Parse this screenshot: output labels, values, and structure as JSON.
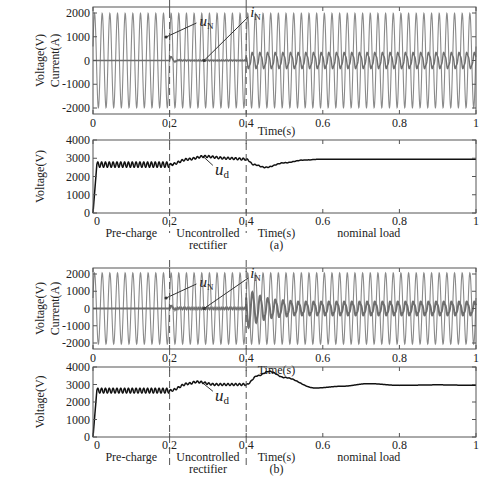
{
  "figure": {
    "panels": [
      {
        "id": "a",
        "caption": "(a)",
        "top_plot": {
          "ylabel_line1": "Voltage(V)",
          "ylabel_line2": "Current(A)",
          "xlabel": "Time(s)",
          "yticks": [
            "2000",
            "1000",
            "0",
            "-1000",
            "-2000"
          ],
          "xticks": [
            "0",
            "0.2",
            "0.4",
            "0.6",
            "0.8",
            "1"
          ],
          "annotations": {
            "voltage": "u",
            "voltage_sub": "N",
            "current": "i",
            "current_sub": "N"
          }
        },
        "bottom_plot": {
          "ylabel": "Voltage(V)",
          "xlabel": "Time(s)",
          "yticks": [
            "4000",
            "3000",
            "2000",
            "1000",
            "0"
          ],
          "xticks": [
            "0",
            "0.2",
            "0.4",
            "0.6",
            "0.8",
            "1"
          ],
          "annotation": "u",
          "annotation_sub": "d",
          "phase_labels": [
            "Pre-charge",
            "Uncontrolled",
            "rectifier",
            "nominal load"
          ]
        }
      },
      {
        "id": "b",
        "caption": "(b)",
        "top_plot": {
          "ylabel_line1": "Voltage(V)",
          "ylabel_line2": "Current(A)",
          "xlabel": "Time(s)",
          "yticks": [
            "2000",
            "1000",
            "0",
            "-1000",
            "-2000"
          ],
          "xticks": [
            "0",
            "0.2",
            "0.4",
            "0.6",
            "0.8",
            "1"
          ],
          "annotations": {
            "voltage": "u",
            "voltage_sub": "N",
            "current": "i",
            "current_sub": "N"
          }
        },
        "bottom_plot": {
          "ylabel": "Voltage(V)",
          "xlabel": "Time(s)",
          "yticks": [
            "4000",
            "3000",
            "2000",
            "1000",
            "0"
          ],
          "xticks": [
            "0",
            "0.2",
            "0.4",
            "0.6",
            "0.8",
            "1"
          ],
          "annotation": "u",
          "annotation_sub": "d",
          "phase_labels": [
            "Pre-charge",
            "Uncontrolled",
            "rectifier",
            "nominal load"
          ]
        }
      }
    ]
  },
  "chart_data": [
    {
      "type": "line",
      "title": "(a) grid voltage and current",
      "xlabel": "Time(s)",
      "ylabel": "Voltage(V) / Current(A)",
      "xlim": [
        0,
        1
      ],
      "ylim": [
        -2500,
        2500
      ],
      "series": [
        {
          "name": "u_N",
          "description": "grid voltage sinusoid, 50 Hz",
          "amplitude": 2200,
          "frequency_hz": 50
        },
        {
          "name": "i_N",
          "description": "grid current",
          "segments": [
            {
              "t": [
                0,
                0.2
              ],
              "amplitude": 0
            },
            {
              "t": [
                0.2,
                0.4
              ],
              "amplitude": 60,
              "note": "small transient at 0.2s then near zero"
            },
            {
              "t": [
                0.4,
                1.0
              ],
              "amplitude": 350
            }
          ]
        }
      ],
      "vlines": [
        0.2,
        0.4
      ]
    },
    {
      "type": "line",
      "title": "(a) DC-link voltage",
      "xlabel": "Time(s)",
      "ylabel": "Voltage(V)",
      "xlim": [
        0,
        1
      ],
      "ylim": [
        0,
        4000
      ],
      "series": [
        {
          "name": "u_d",
          "x": [
            0,
            0.01,
            0.2,
            0.25,
            0.29,
            0.35,
            0.4,
            0.42,
            0.45,
            0.5,
            0.55,
            0.6,
            0.8,
            1.0
          ],
          "y": [
            0,
            2650,
            2650,
            2950,
            3100,
            3000,
            2950,
            2650,
            2500,
            2750,
            2900,
            2950,
            2950,
            2950
          ]
        }
      ],
      "phase_labels": [
        "Pre-charge",
        "Uncontrolled rectifier",
        "nominal load"
      ],
      "vlines": [
        0.2,
        0.4
      ]
    },
    {
      "type": "line",
      "title": "(b) grid voltage and current",
      "xlabel": "Time(s)",
      "ylabel": "Voltage(V) / Current(A)",
      "xlim": [
        0,
        1
      ],
      "ylim": [
        -2500,
        2500
      ],
      "series": [
        {
          "name": "u_N",
          "description": "grid voltage sinusoid, 50 Hz",
          "amplitude": 2200,
          "frequency_hz": 50
        },
        {
          "name": "i_N",
          "description": "grid current",
          "segments": [
            {
              "t": [
                0,
                0.2
              ],
              "amplitude": 0
            },
            {
              "t": [
                0.2,
                0.4
              ],
              "amplitude": 80,
              "note": "transient at 0.2s then noisy near zero"
            },
            {
              "t": [
                0.4,
                0.5
              ],
              "amplitude": 1200,
              "note": "large transient after 0.4s"
            },
            {
              "t": [
                0.5,
                1.0
              ],
              "amplitude": 400
            }
          ]
        }
      ],
      "vlines": [
        0.2,
        0.4
      ]
    },
    {
      "type": "line",
      "title": "(b) DC-link voltage",
      "xlabel": "Time(s)",
      "ylabel": "Voltage(V)",
      "xlim": [
        0,
        1
      ],
      "ylim": [
        0,
        4000
      ],
      "series": [
        {
          "name": "u_d",
          "x": [
            0,
            0.01,
            0.2,
            0.25,
            0.27,
            0.32,
            0.4,
            0.43,
            0.46,
            0.5,
            0.58,
            0.65,
            0.72,
            0.8,
            0.9,
            1.0
          ],
          "y": [
            0,
            2650,
            2650,
            3050,
            3150,
            3000,
            3000,
            3500,
            3750,
            3400,
            2800,
            2900,
            3050,
            2950,
            2980,
            2950
          ]
        }
      ],
      "phase_labels": [
        "Pre-charge",
        "Uncontrolled rectifier",
        "nominal load"
      ],
      "vlines": [
        0.2,
        0.4
      ]
    }
  ]
}
